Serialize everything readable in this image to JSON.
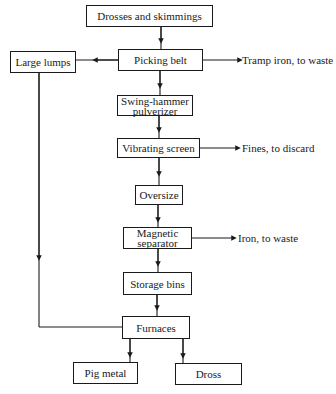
{
  "diagram": {
    "type": "flowchart",
    "nodes": {
      "drosses": {
        "label": "Drosses and skimmings"
      },
      "picking_belt": {
        "label": "Picking belt"
      },
      "large_lumps": {
        "label": "Large lumps"
      },
      "swing_hammer": {
        "line1": "Swing-hammer",
        "line2": "pulverizer"
      },
      "vibrating_screen": {
        "label": "Vibrating screen"
      },
      "oversize": {
        "label": "Oversize"
      },
      "magnetic_separator": {
        "line1": "Magnetic",
        "line2": "separator"
      },
      "storage_bins": {
        "label": "Storage bins"
      },
      "furnaces": {
        "label": "Furnaces"
      },
      "pig_metal": {
        "label": "Pig metal"
      },
      "dross": {
        "label": "Dross"
      }
    },
    "outputs": {
      "tramp_iron": "Tramp iron, to waste",
      "fines": "Fines, to discard",
      "iron": "Iron, to waste"
    },
    "edges": [
      {
        "from": "Drosses and skimmings",
        "to": "Picking belt"
      },
      {
        "from": "Picking belt",
        "to": "Large lumps"
      },
      {
        "from": "Picking belt",
        "to": "Tramp iron, to waste"
      },
      {
        "from": "Picking belt",
        "to": "Swing-hammer pulverizer"
      },
      {
        "from": "Swing-hammer pulverizer",
        "to": "Vibrating screen"
      },
      {
        "from": "Vibrating screen",
        "to": "Fines, to discard"
      },
      {
        "from": "Vibrating screen",
        "to": "Oversize"
      },
      {
        "from": "Oversize",
        "to": "Magnetic separator"
      },
      {
        "from": "Magnetic separator",
        "to": "Iron, to waste"
      },
      {
        "from": "Magnetic separator",
        "to": "Storage bins"
      },
      {
        "from": "Storage bins",
        "to": "Furnaces"
      },
      {
        "from": "Large lumps",
        "to": "Furnaces"
      },
      {
        "from": "Furnaces",
        "to": "Pig metal"
      },
      {
        "from": "Furnaces",
        "to": "Dross"
      }
    ],
    "colors": {
      "line": "#1a1a1a",
      "background": "#ffffff"
    }
  }
}
